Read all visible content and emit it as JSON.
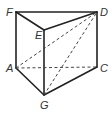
{
  "diagram": {
    "type": "triangular-prism",
    "stroke_color": "#222222",
    "label_color": "#333333",
    "vertices": [
      {
        "name": "F",
        "x": 16,
        "y": 12,
        "lx": 6,
        "ly": 16
      },
      {
        "name": "D",
        "x": 97,
        "y": 12,
        "lx": 100,
        "ly": 16
      },
      {
        "name": "E",
        "x": 44,
        "y": 30,
        "lx": 35,
        "ly": 39
      },
      {
        "name": "A",
        "x": 16,
        "y": 68,
        "lx": 6,
        "ly": 72
      },
      {
        "name": "C",
        "x": 97,
        "y": 67,
        "lx": 100,
        "ly": 72
      },
      {
        "name": "G",
        "x": 44,
        "y": 95,
        "lx": 40,
        "ly": 109
      }
    ],
    "solid_edges": [
      [
        "F",
        "D"
      ],
      [
        "F",
        "E"
      ],
      [
        "E",
        "D"
      ],
      [
        "F",
        "A"
      ],
      [
        "E",
        "G"
      ],
      [
        "D",
        "C"
      ],
      [
        "A",
        "G"
      ],
      [
        "G",
        "C"
      ]
    ],
    "dashed_edges": [
      [
        "A",
        "C"
      ],
      [
        "A",
        "D"
      ],
      [
        "G",
        "D"
      ]
    ],
    "labels": {
      "F": "F",
      "D": "D",
      "E": "E",
      "A": "A",
      "C": "C",
      "G": "G"
    }
  }
}
